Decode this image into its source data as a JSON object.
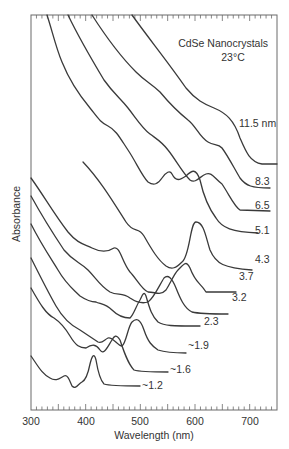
{
  "chart_data": {
    "type": "line",
    "title": "CdSe Nanocrystals",
    "subtitle": "23°C",
    "xlabel": "Wavelength (nm)",
    "ylabel": "Absorbance",
    "xlim": [
      300,
      750
    ],
    "xticks": [
      300,
      400,
      500,
      600,
      700
    ],
    "xtick_labels": [
      "300",
      "400",
      "500",
      "600",
      "700"
    ],
    "yticks": [],
    "grid": false,
    "legend": "inline labels at right end of each curve",
    "series": [
      {
        "name": "11.5 nm",
        "label": "11.5 nm",
        "first_exciton_nm": 680,
        "offset_stacked": true
      },
      {
        "name": "8.3",
        "label": "8.3",
        "first_exciton_nm": 640,
        "offset_stacked": true
      },
      {
        "name": "6.5",
        "label": "6.5",
        "first_exciton_nm": 620,
        "offset_stacked": true
      },
      {
        "name": "5.1",
        "label": "5.1",
        "first_exciton_nm": 600,
        "offset_stacked": true
      },
      {
        "name": "4.3",
        "label": "4.3",
        "first_exciton_nm": 585,
        "offset_stacked": true
      },
      {
        "name": "3.7",
        "label": "3.7",
        "first_exciton_nm": 555,
        "offset_stacked": true
      },
      {
        "name": "3.2",
        "label": "3.2",
        "first_exciton_nm": 540,
        "offset_stacked": true
      },
      {
        "name": "2.3",
        "label": "2.3",
        "first_exciton_nm": 505,
        "offset_stacked": true
      },
      {
        "name": "~1.9",
        "label": "~1.9",
        "first_exciton_nm": 475,
        "offset_stacked": true
      },
      {
        "name": "~1.6",
        "label": "~1.6",
        "first_exciton_nm": 455,
        "offset_stacked": true
      },
      {
        "name": "~1.2",
        "label": "~1.2",
        "first_exciton_nm": 410,
        "offset_stacked": true
      }
    ]
  }
}
